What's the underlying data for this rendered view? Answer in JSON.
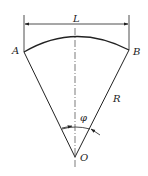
{
  "diagram": {
    "labels": {
      "chord_length": "L",
      "left_point": "A",
      "right_point": "B",
      "radius": "R",
      "angle": "φ",
      "center": "O"
    },
    "colors": {
      "line": "#222222",
      "background": "#ffffff"
    }
  }
}
